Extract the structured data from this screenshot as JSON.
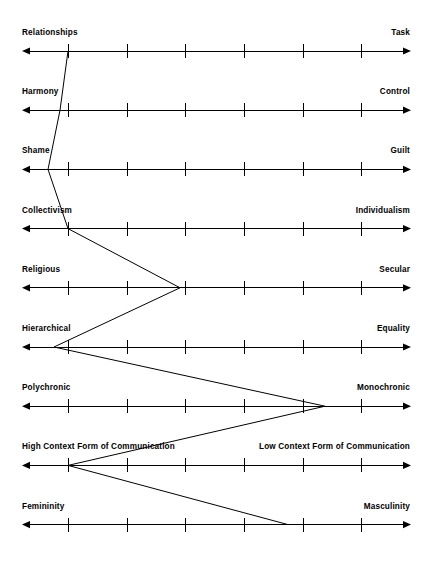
{
  "chart_data": {
    "type": "line",
    "title": "",
    "subtitle": "",
    "xlabel": "",
    "ylabel": "",
    "orientation": "horizontal-bipolar-scales",
    "grid": false,
    "legend": null,
    "axis_count": 9,
    "ticks_per_axis": 6,
    "scale_min": 1,
    "scale_max": 7,
    "categories": [
      "Relationships – Task",
      "Harmony – Control",
      "Shame – Guilt",
      "Collectivism – Individualism",
      "Religious – Secular",
      "Hierarchical – Equality",
      "Polychronic – Monochronic",
      "High Context Form of Communication – Low Context Form of Communication",
      "Femininity – Masculinity"
    ],
    "values": [
      1.0,
      0.85,
      0.67,
      1.0,
      3.0,
      0.75,
      5.4,
      1.0,
      4.7
    ],
    "axes": [
      {
        "index": 0,
        "left_label": "Relationships",
        "right_label": "Task",
        "value": 1.0,
        "marker_x": 68
      },
      {
        "index": 1,
        "left_label": "Harmony",
        "right_label": "Control",
        "value": 0.85,
        "marker_x": 60
      },
      {
        "index": 2,
        "left_label": "Shame",
        "right_label": "Guilt",
        "value": 0.67,
        "marker_x": 48
      },
      {
        "index": 3,
        "left_label": "Collectivism",
        "right_label": "Individualism",
        "value": 1.0,
        "marker_x": 68
      },
      {
        "index": 4,
        "left_label": "Religious",
        "right_label": "Secular",
        "value": 3.0,
        "marker_x": 180
      },
      {
        "index": 5,
        "left_label": "Hierarchical",
        "right_label": "Equality",
        "value": 0.75,
        "marker_x": 54
      },
      {
        "index": 6,
        "left_label": "Polychronic",
        "right_label": "Monochronic",
        "value": 5.4,
        "marker_x": 325
      },
      {
        "index": 7,
        "left_label": "High Context Form of Communication",
        "right_label": "Low Context Form of Communication",
        "value": 1.0,
        "marker_x": 68
      },
      {
        "index": 8,
        "left_label": "Femininity",
        "right_label": "Masculinity",
        "value": 4.7,
        "marker_x": 288
      }
    ]
  }
}
